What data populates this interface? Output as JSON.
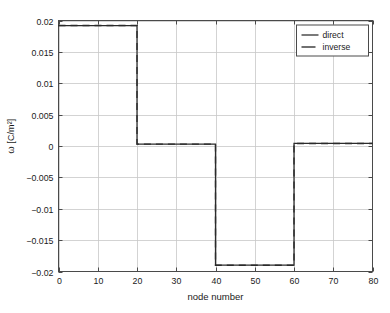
{
  "chart_data": {
    "type": "line",
    "title": "",
    "xlabel": "node number",
    "ylabel": "ω [C/m²]",
    "xlim": [
      0,
      80
    ],
    "ylim": [
      -0.02,
      0.02
    ],
    "xticks": [
      0,
      10,
      20,
      30,
      40,
      50,
      60,
      70,
      80
    ],
    "xtick_labels": [
      "0",
      "10",
      "20",
      "30",
      "40",
      "50",
      "60",
      "70",
      "80"
    ],
    "yticks": [
      0.02,
      0.015,
      0.01,
      0.005,
      0,
      -0.005,
      -0.01,
      -0.015,
      -0.02
    ],
    "ytick_labels": [
      "0.02",
      "0.015",
      "0.01",
      "0.005",
      "0",
      "−0.005",
      "−0.01",
      "−0.015",
      "−0.02"
    ],
    "grid": true,
    "legend_position": "upper right",
    "series": [
      {
        "name": "direct",
        "style": "solid",
        "color": "#2b2b2b",
        "x": [
          0,
          20,
          20,
          40,
          40,
          60,
          60,
          80
        ],
        "y": [
          0.0192,
          0.0192,
          0.0003,
          0.0003,
          -0.019,
          -0.019,
          0.0004,
          0.0004
        ]
      },
      {
        "name": "inverse",
        "style": "dashed",
        "color": "#2b2b2b",
        "x": [
          0,
          20,
          20,
          40,
          40,
          60,
          60,
          80
        ],
        "y": [
          0.0192,
          0.0192,
          0.0003,
          0.0003,
          -0.019,
          -0.019,
          0.0004,
          0.0004
        ]
      }
    ],
    "annotations": []
  },
  "legend": {
    "entries": [
      {
        "label": "direct",
        "style": "solid"
      },
      {
        "label": "inverse",
        "style": "dashed"
      }
    ]
  },
  "colors": {
    "line": "#2b2b2b",
    "grid": "#c8c8c8",
    "axis": "#4a4a4a",
    "background": "#ffffff",
    "text": "#1a1a1a"
  }
}
